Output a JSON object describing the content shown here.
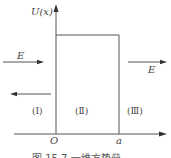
{
  "diagram": {
    "y_axis_label": "U(x)",
    "origin_label": "O",
    "barrier_end_label": "a",
    "incident_label": "E",
    "transmitted_label": "E",
    "regions": [
      "(Ⅰ)",
      "(Ⅱ)",
      "(Ⅲ)"
    ],
    "caption": "图 15.7   一维方势垒"
  }
}
